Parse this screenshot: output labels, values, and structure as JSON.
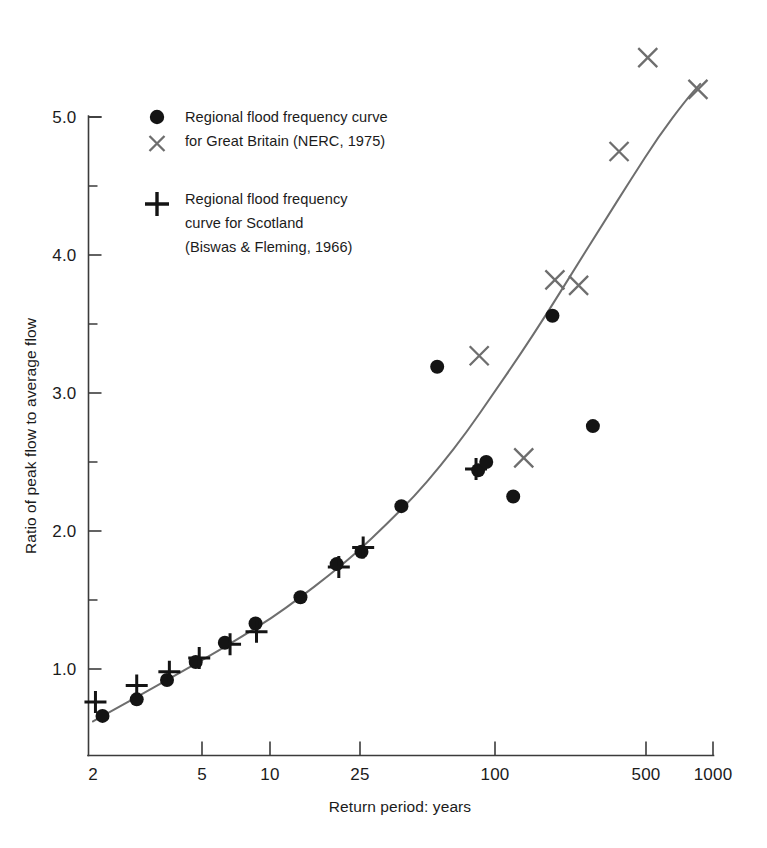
{
  "chart_data": {
    "type": "scatter",
    "title": "",
    "xlabel": "Return period: years",
    "ylabel": "Ratio of peak flow to average flow",
    "xscale": "log",
    "yscale": "linear",
    "xlim": [
      2,
      1000
    ],
    "ylim": [
      0.6,
      5.35
    ],
    "grid": false,
    "legend_position": "upper-left-inside",
    "x_ticks": [
      {
        "value": 2,
        "label": "2",
        "px": 93
      },
      {
        "value": 5,
        "label": "5",
        "px": 202
      },
      {
        "value": 10,
        "label": "10",
        "px": 270
      },
      {
        "value": 25,
        "label": "25",
        "px": 360
      },
      {
        "value": 100,
        "label": "100",
        "px": 495
      },
      {
        "value": 500,
        "label": "500",
        "px": 646
      },
      {
        "value": 1000,
        "label": "1000",
        "px": 713
      }
    ],
    "y_ticks_major": [
      {
        "value": 1.0,
        "label": "1.0"
      },
      {
        "value": 2.0,
        "label": "2.0"
      },
      {
        "value": 3.0,
        "label": "3.0"
      },
      {
        "value": 4.0,
        "label": "4.0"
      },
      {
        "value": 5.0,
        "label": "5.0"
      }
    ],
    "y_ticks_minor": [
      1.5,
      2.5,
      3.5,
      4.5
    ],
    "series": [
      {
        "name": "Regional flood frequency curve for Great Britain (NERC, 1975)",
        "marker": "circle",
        "color": "#141414",
        "points": [
          {
            "x": 2.2,
            "y": 0.66
          },
          {
            "x": 3.1,
            "y": 0.78
          },
          {
            "x": 4.2,
            "y": 0.92
          },
          {
            "x": 5.6,
            "y": 1.05
          },
          {
            "x": 7.5,
            "y": 1.19
          },
          {
            "x": 10.2,
            "y": 1.33
          },
          {
            "x": 16.0,
            "y": 1.52
          },
          {
            "x": 23.0,
            "y": 1.76
          },
          {
            "x": 29.5,
            "y": 1.85
          },
          {
            "x": 44.0,
            "y": 2.18
          },
          {
            "x": 63.0,
            "y": 3.19
          },
          {
            "x": 95.0,
            "y": 2.44
          },
          {
            "x": 103.0,
            "y": 2.5
          },
          {
            "x": 135.0,
            "y": 2.25
          },
          {
            "x": 200.0,
            "y": 3.56
          },
          {
            "x": 300.0,
            "y": 2.76
          }
        ]
      },
      {
        "name": "Regional flood frequency curve for Scotland (Biswas & Fleming, 1966)",
        "marker": "plus",
        "color": "#141414",
        "points": [
          {
            "x": 2.05,
            "y": 0.76
          },
          {
            "x": 3.1,
            "y": 0.88
          },
          {
            "x": 4.3,
            "y": 0.98
          },
          {
            "x": 5.8,
            "y": 1.08
          },
          {
            "x": 7.9,
            "y": 1.18
          },
          {
            "x": 10.3,
            "y": 1.27
          },
          {
            "x": 23.5,
            "y": 1.74
          },
          {
            "x": 30.0,
            "y": 1.88
          },
          {
            "x": 93.0,
            "y": 2.45
          }
        ]
      },
      {
        "name": "Great Britain X markers",
        "marker": "cross",
        "color": "#6e6e6e",
        "points": [
          {
            "x": 96.0,
            "y": 3.27
          },
          {
            "x": 150.0,
            "y": 2.53
          },
          {
            "x": 205.0,
            "y": 3.82
          },
          {
            "x": 260.0,
            "y": 3.78
          },
          {
            "x": 390.0,
            "y": 4.75
          },
          {
            "x": 520.0,
            "y": 5.43
          },
          {
            "x": 860.0,
            "y": 5.2
          }
        ]
      }
    ],
    "fit_curve": {
      "name": "Regional flood frequency curve",
      "color": "#6e6e6e",
      "points": [
        {
          "x": 2.0,
          "y": 0.62
        },
        {
          "x": 2.5,
          "y": 0.71
        },
        {
          "x": 3.2,
          "y": 0.81
        },
        {
          "x": 4.2,
          "y": 0.92
        },
        {
          "x": 5.5,
          "y": 1.03
        },
        {
          "x": 7.0,
          "y": 1.13
        },
        {
          "x": 9.0,
          "y": 1.24
        },
        {
          "x": 12.0,
          "y": 1.37
        },
        {
          "x": 16.0,
          "y": 1.52
        },
        {
          "x": 21.0,
          "y": 1.67
        },
        {
          "x": 28.0,
          "y": 1.84
        },
        {
          "x": 38.0,
          "y": 2.05
        },
        {
          "x": 50.0,
          "y": 2.25
        },
        {
          "x": 65.0,
          "y": 2.47
        },
        {
          "x": 85.0,
          "y": 2.72
        },
        {
          "x": 110.0,
          "y": 2.99
        },
        {
          "x": 145.0,
          "y": 3.28
        },
        {
          "x": 190.0,
          "y": 3.58
        },
        {
          "x": 250.0,
          "y": 3.9
        },
        {
          "x": 330.0,
          "y": 4.22
        },
        {
          "x": 440.0,
          "y": 4.55
        },
        {
          "x": 580.0,
          "y": 4.86
        },
        {
          "x": 760.0,
          "y": 5.12
        },
        {
          "x": 880.0,
          "y": 5.24
        }
      ]
    }
  },
  "legend": {
    "entries": [
      {
        "markers": [
          "circle",
          "cross"
        ],
        "lines": [
          "Regional flood frequency curve",
          "for Great Britain (NERC, 1975)"
        ]
      },
      {
        "markers": [
          "plus"
        ],
        "lines": [
          "Regional flood frequency",
          "curve for Scotland",
          "(Biswas & Fleming, 1966)"
        ]
      }
    ]
  },
  "colors": {
    "axis": "#3b3b3b",
    "text": "#1b1b1b",
    "circle_marker": "#141414",
    "cross_marker": "#6e6e6e",
    "plus_marker": "#141414",
    "curve": "#6e6e6e",
    "background": "#ffffff"
  }
}
